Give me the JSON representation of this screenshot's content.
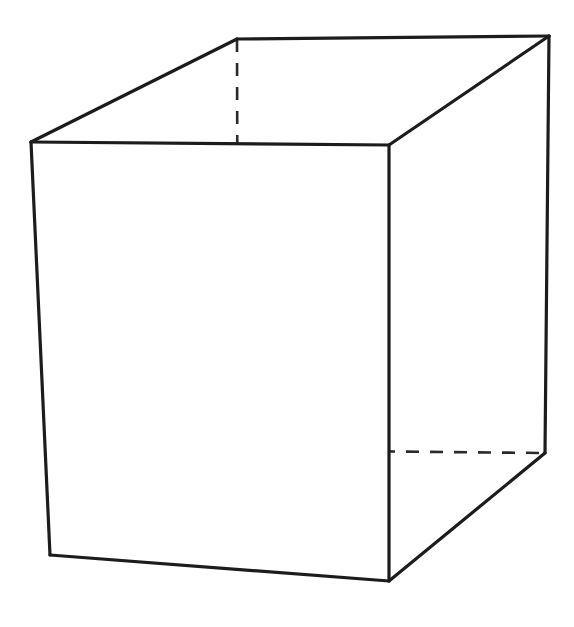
{
  "figure": {
    "kind": "line-drawing",
    "canvas": {
      "width": 574,
      "height": 627
    },
    "colors": {
      "background": "#ffffff",
      "stroke_visible": "#1c1c1c",
      "stroke_hidden": "#2a2a2a",
      "face_fill": "#ffffff"
    },
    "stroke": {
      "visible_width": 3.2,
      "hidden_width": 2.6,
      "hidden_dash": "13 11"
    },
    "vertices": {
      "front_top_left": {
        "x": 31,
        "y": 142,
        "visible": true
      },
      "front_top_right": {
        "x": 389,
        "y": 145,
        "visible": true
      },
      "front_bottom_left": {
        "x": 50,
        "y": 555,
        "visible": true
      },
      "front_bottom_right": {
        "x": 389,
        "y": 581,
        "visible": true
      },
      "back_top_left": {
        "x": 237,
        "y": 39,
        "visible": false
      },
      "back_top_right": {
        "x": 549,
        "y": 36,
        "visible": true
      },
      "back_bottom_left": {
        "x": 238,
        "y": 450,
        "visible": false
      },
      "back_bottom_right": {
        "x": 545,
        "y": 453,
        "visible": true
      }
    },
    "faces": {
      "front": "31,142 389,145 389,581 50,555",
      "top": "31,142 237,39 549,36 389,145",
      "right": "389,145 549,36 545,453 389,581"
    },
    "edges_visible": [
      {
        "name": "front-top",
        "points": "31,142 389,145"
      },
      {
        "name": "front-left",
        "points": "31,142 50,555"
      },
      {
        "name": "front-bottom",
        "points": "50,555 389,581"
      },
      {
        "name": "front-right",
        "points": "389,145 389,581"
      },
      {
        "name": "top-left-slant",
        "points": "31,142 237,39"
      },
      {
        "name": "top-back",
        "points": "237,39 549,36"
      },
      {
        "name": "top-right-slant",
        "points": "389,145 549,36"
      },
      {
        "name": "back-right-vertical",
        "points": "549,36 545,453"
      },
      {
        "name": "bottom-right-slant",
        "points": "545,453 389,581"
      }
    ],
    "edges_hidden": [
      {
        "name": "back-left-vertical",
        "points": "237,39 238,450"
      },
      {
        "name": "back-bottom-left-slant",
        "points": "50,555 238,450"
      },
      {
        "name": "back-bottom-horizontal",
        "points": "238,450 545,453"
      }
    ]
  }
}
